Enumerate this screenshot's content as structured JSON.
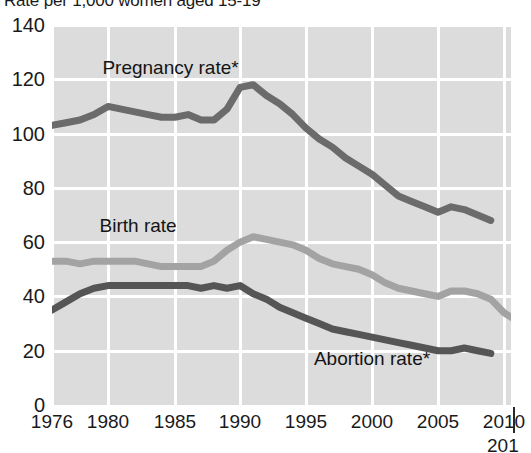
{
  "chart_data": {
    "type": "line",
    "title": "Rate per 1,000 women aged 15-19",
    "xlabel": "",
    "ylabel": "",
    "ylim": [
      0,
      140
    ],
    "ytick_step": 20,
    "yticks": [
      "0",
      "20",
      "40",
      "60",
      "80",
      "100",
      "120",
      "140"
    ],
    "xlim": [
      1976,
      2011
    ],
    "xticks": [
      "1976",
      "1980",
      "1985",
      "1990",
      "1995",
      "2000",
      "2005",
      "2010"
    ],
    "xtick_values": [
      1976,
      1980,
      1985,
      1990,
      1995,
      2000,
      2005,
      2010
    ],
    "xtick_extra": "201",
    "grid": true,
    "legend_position": "inline-annotations",
    "plot_background": "#dcdcdc",
    "gridline_color": "#ffffff",
    "series": [
      {
        "name": "Pregnancy rate*",
        "color": "#6b6b6b",
        "label_x": 1979.6,
        "label_y": 124,
        "x": [
          1976,
          1977,
          1978,
          1979,
          1980,
          1981,
          1982,
          1983,
          1984,
          1985,
          1986,
          1987,
          1988,
          1989,
          1990,
          1991,
          1992,
          1993,
          1994,
          1995,
          1996,
          1997,
          1998,
          1999,
          2000,
          2001,
          2002,
          2003,
          2004,
          2005,
          2006,
          2007,
          2008,
          2009
        ],
        "values": [
          103,
          104,
          105,
          107,
          110,
          109,
          108,
          107,
          106,
          106,
          107,
          105,
          105,
          109,
          117,
          118,
          114,
          111,
          107,
          102,
          98,
          95,
          91,
          88,
          85,
          81,
          77,
          75,
          73,
          71,
          73,
          72,
          70,
          68
        ]
      },
      {
        "name": "Birth rate",
        "color": "#a3a3a3",
        "label_x": 1979.4,
        "label_y": 66,
        "x": [
          1976,
          1977,
          1978,
          1979,
          1980,
          1981,
          1982,
          1983,
          1984,
          1985,
          1986,
          1987,
          1988,
          1989,
          1990,
          1991,
          1992,
          1993,
          1994,
          1995,
          1996,
          1997,
          1998,
          1999,
          2000,
          2001,
          2002,
          2003,
          2004,
          2005,
          2006,
          2007,
          2008,
          2009,
          2010,
          2011
        ],
        "values": [
          53,
          53,
          52,
          53,
          53,
          53,
          53,
          52,
          51,
          51,
          51,
          51,
          53,
          57,
          60,
          62,
          61,
          60,
          59,
          57,
          54,
          52,
          51,
          50,
          48,
          45,
          43,
          42,
          41,
          40,
          42,
          42,
          41,
          39,
          34,
          31
        ]
      },
      {
        "name": "Abortion rate*",
        "color": "#555555",
        "label_x": 1995.6,
        "label_y": 17,
        "x": [
          1976,
          1977,
          1978,
          1979,
          1980,
          1981,
          1982,
          1983,
          1984,
          1985,
          1986,
          1987,
          1988,
          1989,
          1990,
          1991,
          1992,
          1993,
          1994,
          1995,
          1996,
          1997,
          1998,
          1999,
          2000,
          2001,
          2002,
          2003,
          2004,
          2005,
          2006,
          2007,
          2008,
          2009
        ],
        "values": [
          35,
          38,
          41,
          43,
          44,
          44,
          44,
          44,
          44,
          44,
          44,
          43,
          44,
          43,
          44,
          41,
          39,
          36,
          34,
          32,
          30,
          28,
          27,
          26,
          25,
          24,
          23,
          22,
          21,
          20,
          20,
          21,
          20,
          19
        ]
      }
    ]
  }
}
